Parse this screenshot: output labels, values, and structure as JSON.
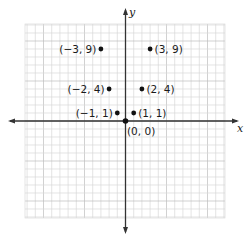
{
  "chart_data": {
    "type": "scatter",
    "title": "",
    "xlabel": "x",
    "ylabel": "y",
    "xlim": [
      -12,
      12
    ],
    "ylim": [
      -12,
      12
    ],
    "grid": true,
    "legend": null,
    "points": [
      {
        "x": -3,
        "y": 9,
        "label": "(−3, 9)",
        "label_side": "left"
      },
      {
        "x": 3,
        "y": 9,
        "label": "(3, 9)",
        "label_side": "right"
      },
      {
        "x": -2,
        "y": 4,
        "label": "(−2, 4)",
        "label_side": "left"
      },
      {
        "x": 2,
        "y": 4,
        "label": "(2, 4)",
        "label_side": "right"
      },
      {
        "x": -1,
        "y": 1,
        "label": "(−1, 1)",
        "label_side": "left"
      },
      {
        "x": 1,
        "y": 1,
        "label": "(1, 1)",
        "label_side": "right"
      },
      {
        "x": 0,
        "y": 0,
        "label": "(0, 0)",
        "label_side": "below"
      }
    ]
  },
  "axes": {
    "x_label": "x",
    "y_label": "y"
  },
  "colors": {
    "grid_minor": "#d9d9d9",
    "grid_major": "#bdbdbd",
    "axis": "#333333",
    "point": "#111111"
  }
}
